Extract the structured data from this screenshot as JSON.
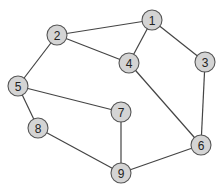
{
  "graph": {
    "node_color": "#d4d4d4",
    "stroke_color": "#555555",
    "edge_color": "#444444",
    "nodes": [
      {
        "id": "1",
        "label": "1",
        "x": 152,
        "y": 20
      },
      {
        "id": "2",
        "label": "2",
        "x": 57,
        "y": 35
      },
      {
        "id": "3",
        "label": "3",
        "x": 205,
        "y": 62
      },
      {
        "id": "4",
        "label": "4",
        "x": 129,
        "y": 63
      },
      {
        "id": "5",
        "label": "5",
        "x": 18,
        "y": 86
      },
      {
        "id": "6",
        "label": "6",
        "x": 201,
        "y": 145
      },
      {
        "id": "7",
        "label": "7",
        "x": 121,
        "y": 112
      },
      {
        "id": "8",
        "label": "8",
        "x": 38,
        "y": 128
      },
      {
        "id": "9",
        "label": "9",
        "x": 121,
        "y": 173
      }
    ],
    "edges": [
      [
        "1",
        "2"
      ],
      [
        "1",
        "4"
      ],
      [
        "1",
        "3"
      ],
      [
        "2",
        "4"
      ],
      [
        "2",
        "5"
      ],
      [
        "3",
        "6"
      ],
      [
        "4",
        "6"
      ],
      [
        "5",
        "7"
      ],
      [
        "5",
        "8"
      ],
      [
        "7",
        "9"
      ],
      [
        "8",
        "9"
      ],
      [
        "9",
        "6"
      ]
    ]
  }
}
